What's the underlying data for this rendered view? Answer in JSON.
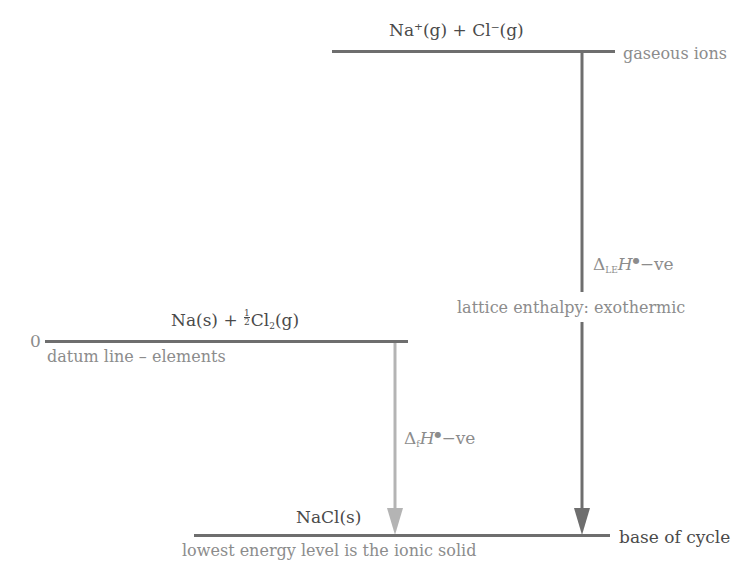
{
  "diagram": {
    "levels": {
      "gaseous_ions": {
        "species": "Na⁺(g) + Cl⁻(g)",
        "label": "gaseous ions"
      },
      "elements": {
        "zero_label": "0",
        "species_prefix": "Na(s) + ",
        "fraction_num": "1",
        "fraction_den": "2",
        "species_cl": "Cl",
        "species_cl_sub": "2",
        "species_suffix": "(g)",
        "label": "datum line – elements"
      },
      "ionic_solid": {
        "species": "NaCl(s)",
        "label": "lowest energy level is the ionic solid",
        "side_label": "base of cycle"
      }
    },
    "arrows": {
      "lattice": {
        "delta": "Δ",
        "subscript": "LE",
        "symbol": "H",
        "std": "⭘",
        "sign": "−ve",
        "caption": "lattice enthalpy: exothermic",
        "color": "#6e6e6e"
      },
      "formation": {
        "delta": "Δ",
        "subscript": "f",
        "symbol": "H",
        "std": "⭘",
        "sign": "−ve",
        "color": "#b4b4b4"
      }
    },
    "colors": {
      "line": "#6e6e6e",
      "text_dark": "#4a4a4a",
      "text_grey": "#8c8c8c",
      "formation_arrow": "#b4b4b4"
    }
  }
}
